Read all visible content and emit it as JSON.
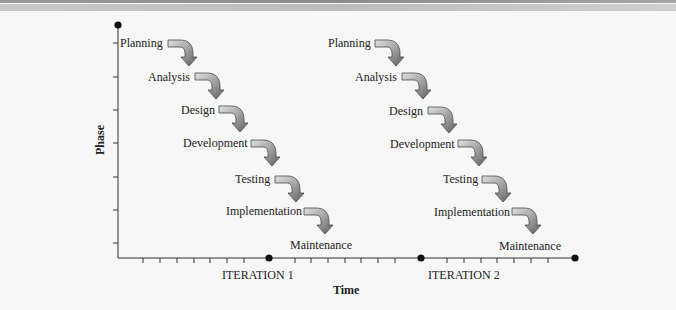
{
  "diagram": {
    "type": "iterative-waterfall",
    "y_axis_title": "Phase",
    "x_axis_title": "Time",
    "iterations": [
      {
        "label": "ITERATION 1",
        "phases": [
          {
            "label": "Planning",
            "x": 120,
            "y": 37,
            "w": 44
          },
          {
            "label": "Analysis",
            "x": 148,
            "y": 70,
            "w": 42
          },
          {
            "label": "Design",
            "x": 181,
            "y": 103,
            "w": 34
          },
          {
            "label": "Development",
            "x": 183,
            "y": 137,
            "w": 64
          },
          {
            "label": "Testing",
            "x": 235,
            "y": 173,
            "w": 35
          },
          {
            "label": "Implementation",
            "x": 226,
            "y": 205,
            "w": 75
          },
          {
            "label": "Maintenance",
            "x": 290,
            "y": 239,
            "w": 60
          }
        ]
      },
      {
        "label": "ITERATION 2",
        "phases": [
          {
            "label": "Planning",
            "x": 328,
            "y": 37,
            "w": 44
          },
          {
            "label": "Analysis",
            "x": 355,
            "y": 70,
            "w": 42
          },
          {
            "label": "Design",
            "x": 389,
            "y": 104,
            "w": 34
          },
          {
            "label": "Development",
            "x": 390,
            "y": 137,
            "w": 64
          },
          {
            "label": "Testing",
            "x": 443,
            "y": 173,
            "w": 35
          },
          {
            "label": "Implementation",
            "x": 434,
            "y": 205,
            "w": 75
          },
          {
            "label": "Maintenance",
            "x": 499,
            "y": 239,
            "w": 60
          }
        ]
      }
    ],
    "colors": {
      "axis": "#333333",
      "arrow_fill_light": "#d8d8d8",
      "arrow_fill_dark": "#6e6e6e",
      "arrow_stroke": "#4a4a4a",
      "dot": "#111111"
    }
  },
  "labels": {
    "phase_axis": "Phase",
    "time_axis": "Time",
    "iteration_1": "ITERATION 1",
    "iteration_2": "ITERATION 2",
    "i1_planning": "Planning",
    "i1_analysis": "Analysis",
    "i1_design": "Design",
    "i1_development": "Development",
    "i1_testing": "Testing",
    "i1_implementation": "Implementation",
    "i1_maintenance": "Maintenance",
    "i2_planning": "Planning",
    "i2_analysis": "Analysis",
    "i2_design": "Design",
    "i2_development": "Development",
    "i2_testing": "Testing",
    "i2_implementation": "Implementation",
    "i2_maintenance": "Maintenance"
  }
}
